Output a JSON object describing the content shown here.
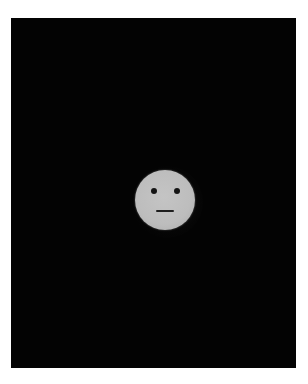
{
  "image": {
    "description": "Grey neutral-expression face on a black background",
    "background_color": "#030303",
    "border_color": "#ffffff",
    "face": {
      "expression": "neutral",
      "color": "#bdbdbd",
      "features": [
        "left-eye",
        "right-eye",
        "straight-mouth"
      ]
    }
  }
}
